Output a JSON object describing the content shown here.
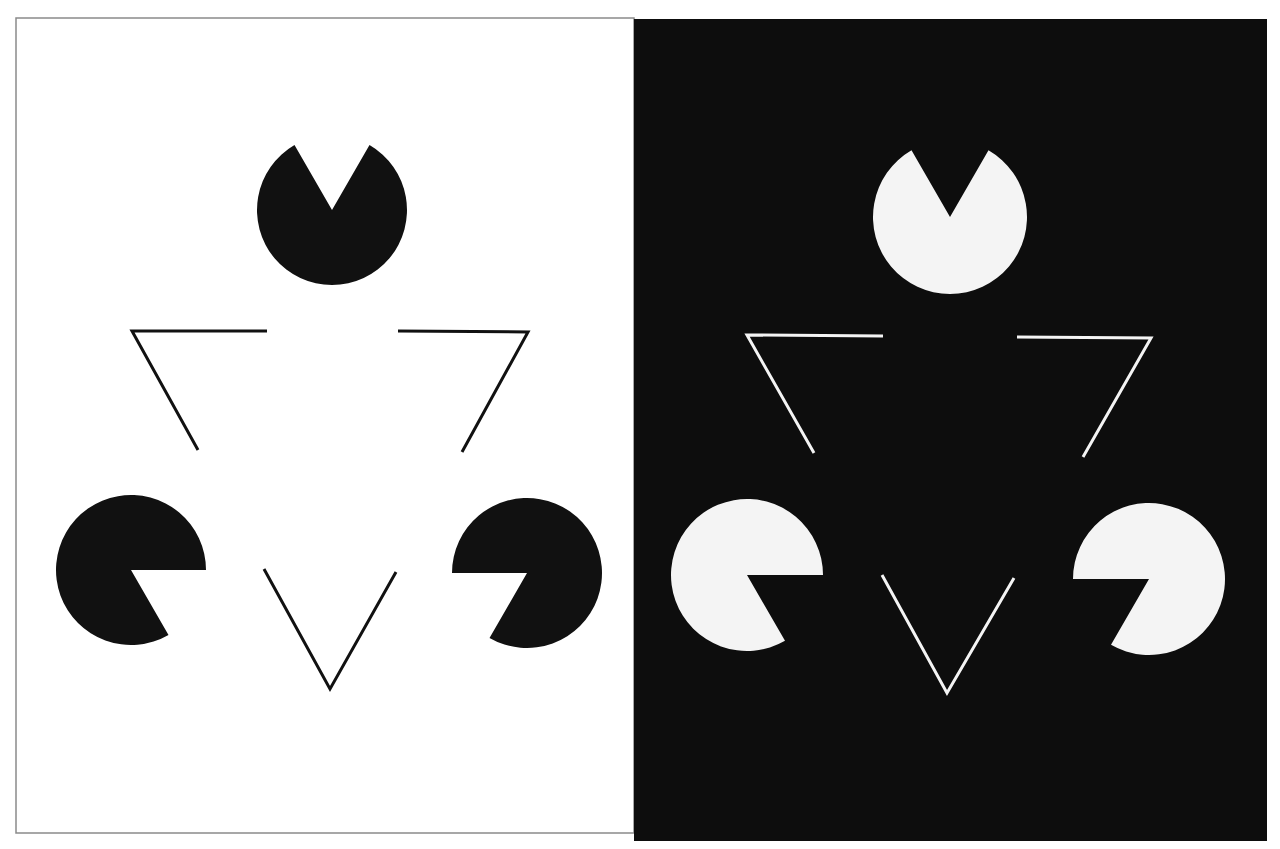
{
  "figure": {
    "panels": [
      {
        "id": "left",
        "background": "#ffffff",
        "foreground": "#111111",
        "border": "#8a8a8a",
        "rect": [
          16,
          18,
          634,
          833
        ],
        "pacmen": [
          {
            "cx": 332,
            "cy": 210,
            "r": 75,
            "notch_start_deg": 60,
            "notch_end_deg": 120
          },
          {
            "cx": 131,
            "cy": 570,
            "r": 75,
            "notch_start_deg": -60,
            "notch_end_deg": 0
          },
          {
            "cx": 527,
            "cy": 573,
            "r": 75,
            "notch_start_deg": 180,
            "notch_end_deg": 240
          }
        ],
        "outline_segments": [
          [
            [
              267,
              331
            ],
            [
              132,
              331
            ],
            [
              198,
              450
            ]
          ],
          [
            [
              398,
              331
            ],
            [
              528,
              332
            ],
            [
              462,
              452
            ]
          ],
          [
            [
              264,
              569
            ],
            [
              330,
              689
            ],
            [
              396,
              572
            ]
          ]
        ]
      },
      {
        "id": "right",
        "background": "#0d0d0d",
        "foreground": "#f4f4f4",
        "border": "none",
        "rect": [
          634,
          19,
          1267,
          841
        ],
        "pacmen": [
          {
            "cx": 950,
            "cy": 217,
            "r": 77,
            "notch_start_deg": 60,
            "notch_end_deg": 120
          },
          {
            "cx": 747,
            "cy": 575,
            "r": 76,
            "notch_start_deg": -60,
            "notch_end_deg": 0
          },
          {
            "cx": 1149,
            "cy": 579,
            "r": 76,
            "notch_start_deg": 180,
            "notch_end_deg": 240
          }
        ],
        "outline_segments": [
          [
            [
              883,
              336
            ],
            [
              747,
              335
            ],
            [
              814,
              453
            ]
          ],
          [
            [
              1017,
              337
            ],
            [
              1151,
              338
            ],
            [
              1083,
              457
            ]
          ],
          [
            [
              882,
              575
            ],
            [
              947,
              693
            ],
            [
              1014,
              578
            ]
          ]
        ]
      }
    ],
    "stroke_width": 3
  }
}
